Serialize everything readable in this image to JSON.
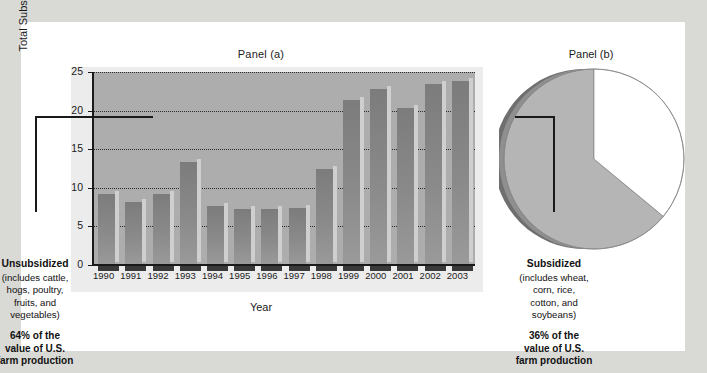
{
  "figure": {
    "panel_a_title": "Panel (a)",
    "panel_b_title": "Panel (b)"
  },
  "chart_data": [
    {
      "type": "bar",
      "title": "Panel (a)",
      "xlabel": "Year",
      "ylabel": "Total Subsidies ($ billions)",
      "categories": [
        "1990",
        "1991",
        "1992",
        "1993",
        "1994",
        "1995",
        "1996",
        "1997",
        "1998",
        "1999",
        "2000",
        "2001",
        "2002",
        "2003"
      ],
      "values": [
        9.2,
        8.2,
        9.2,
        13.3,
        7.7,
        7.3,
        7.3,
        7.4,
        12.5,
        21.4,
        22.8,
        20.3,
        23.5,
        23.8
      ],
      "ylim": [
        0,
        25
      ],
      "yticks": [
        0,
        5,
        10,
        15,
        20,
        25
      ],
      "ytick_labels": [
        "0",
        "5",
        "10",
        "15",
        "20",
        "25"
      ],
      "grid": true,
      "legend": "none",
      "bar_color": "#8a8a8a",
      "plot_background": "#adadad"
    },
    {
      "type": "pie",
      "title": "Panel (b)",
      "labels": [
        "Subsidized",
        "Unsubsidized"
      ],
      "values": [
        36,
        64
      ],
      "colors": [
        "#ffffff",
        "#b5b5b5"
      ],
      "legend": "callout-labels",
      "annotations": [
        "64% of the value of U.S. farm production",
        "36% of the value of U.S. farm production"
      ]
    }
  ],
  "pie_callouts": {
    "left": {
      "title": "Unsubsidized",
      "body": "(includes cattle,\nhogs, poultry,\nfruits, and\nvegetables)",
      "pct": "64% of the\nvalue of U.S.\nfarm production"
    },
    "right": {
      "title": "Subsidized",
      "body": "(includes wheat,\ncorn, rice,\ncotton, and\nsoybeans)",
      "pct": "36% of the\nvalue of U.S.\nfarm production"
    }
  }
}
